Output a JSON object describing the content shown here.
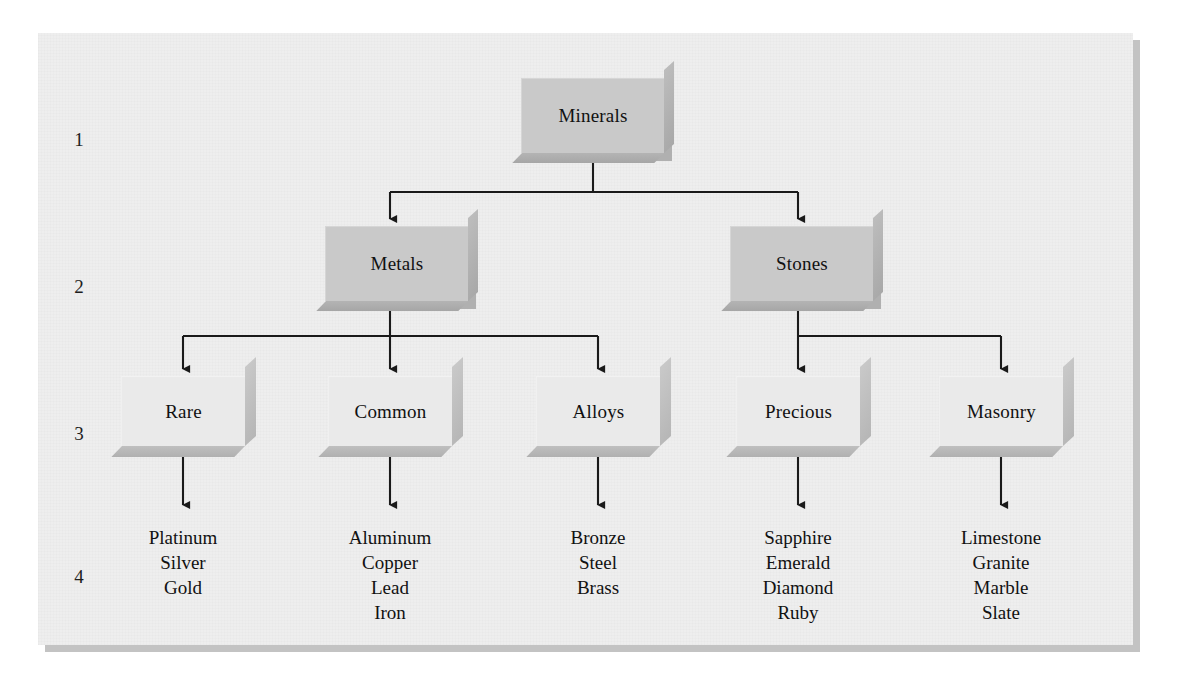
{
  "diagram": {
    "panel_color": "#eeeeee",
    "node_color": "#c9c9c9",
    "leaf_box_color": "#eaeaea",
    "line_color": "#1a1a1a",
    "levels": [
      {
        "number": "1"
      },
      {
        "number": "2"
      },
      {
        "number": "3"
      },
      {
        "number": "4"
      }
    ],
    "level1": [
      {
        "id": "minerals",
        "label": "Minerals"
      }
    ],
    "level2": [
      {
        "id": "metals",
        "label": "Metals"
      },
      {
        "id": "stones",
        "label": "Stones"
      }
    ],
    "level3": [
      {
        "id": "rare",
        "label": "Rare"
      },
      {
        "id": "common",
        "label": "Common"
      },
      {
        "id": "alloys",
        "label": "Alloys"
      },
      {
        "id": "precious",
        "label": "Precious"
      },
      {
        "id": "masonry",
        "label": "Masonry"
      }
    ],
    "level4": [
      {
        "id": "rare-items",
        "parent": "Rare",
        "items": "Platinum\nSilver\nGold"
      },
      {
        "id": "common-items",
        "parent": "Common",
        "items": "Aluminum\nCopper\nLead\nIron"
      },
      {
        "id": "alloys-items",
        "parent": "Alloys",
        "items": "Bronze\nSteel\nBrass"
      },
      {
        "id": "precious-items",
        "parent": "Precious",
        "items": "Sapphire\nEmerald\nDiamond\nRuby"
      },
      {
        "id": "masonry-items",
        "parent": "Masonry",
        "items": "Limestone\nGranite\nMarble\nSlate"
      }
    ]
  }
}
